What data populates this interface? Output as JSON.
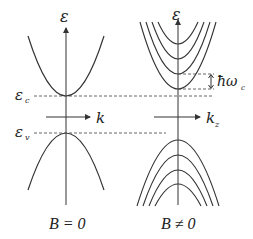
{
  "diagram": {
    "colors": {
      "line": "#333333",
      "dashed": "#555555",
      "background": "#ffffff"
    },
    "left_panel": {
      "energy_axis_label": "ε",
      "momentum_axis_label": "k",
      "conduction_edge_label": "ε",
      "conduction_edge_subscript": "c",
      "valence_edge_label": "ε",
      "valence_edge_subscript": "v",
      "caption": "B = 0"
    },
    "right_panel": {
      "energy_axis_label": "ε",
      "momentum_axis_label": "k",
      "momentum_axis_subscript": "z",
      "spacing_label": "ħω",
      "spacing_subscript": "c",
      "caption": "B ≠ 0",
      "conduction_landau_levels": 4,
      "valence_landau_levels": 4
    }
  }
}
